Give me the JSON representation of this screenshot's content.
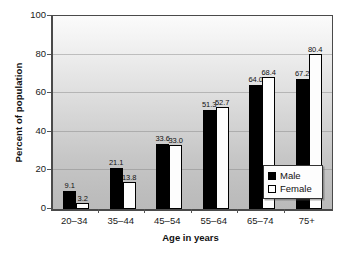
{
  "chart_data": {
    "type": "bar",
    "title": "",
    "subtitle": "",
    "xlabel": "Age in years",
    "ylabel": "Percent of population",
    "categories": [
      "20–34",
      "35–44",
      "45–54",
      "55–64",
      "65–74",
      "75+"
    ],
    "series": [
      {
        "name": "Male",
        "color": "#000000",
        "values": [
          9.1,
          21.1,
          33.6,
          51.3,
          64.0,
          67.2
        ]
      },
      {
        "name": "Female",
        "color": "#ffffff",
        "values": [
          3.2,
          13.8,
          33.0,
          52.7,
          68.4,
          80.4
        ]
      }
    ],
    "value_labels": {
      "Male": [
        "9.1",
        "21.1",
        "33.6",
        "51.3",
        "64.0",
        "67.2"
      ],
      "Female": [
        "3.2",
        "13.8",
        "33.0",
        "52.7",
        "68.4",
        "80.4"
      ]
    },
    "ylim": [
      0,
      100
    ],
    "yticks": [
      0,
      20,
      40,
      60,
      80,
      100
    ],
    "ytick_labels": [
      "0",
      "20",
      "40",
      "60",
      "80",
      "100"
    ],
    "grid": true,
    "grid_axis": "y",
    "legend_position": "lower right",
    "legend_entries": [
      "Male",
      "Female"
    ],
    "plot_background": "gray-vertical-gradient"
  },
  "axes": {
    "y_title": "Percent of population",
    "x_title": "Age in years",
    "y_ticks": [
      "100",
      "80",
      "60",
      "40",
      "20",
      "0"
    ],
    "x_ticks": [
      "20–34",
      "35–44",
      "45–54",
      "55–64",
      "65–74",
      "75+"
    ]
  },
  "legend": {
    "items": [
      {
        "label": "Male",
        "swatch": "filled-black-square"
      },
      {
        "label": "Female",
        "swatch": "outlined-white-square"
      }
    ]
  }
}
